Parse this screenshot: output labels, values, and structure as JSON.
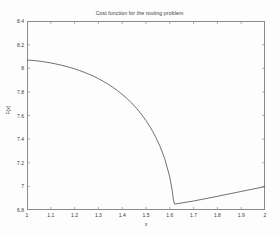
{
  "chart_data": {
    "type": "line",
    "title": "Cost function for the routing problem",
    "xlabel": "x",
    "ylabel": "F(x)",
    "xlim": [
      1,
      2
    ],
    "ylim": [
      6.8,
      8.4
    ],
    "grid": false,
    "legend": null,
    "xticks": [
      "1",
      "1.1",
      "1.2",
      "1.3",
      "1.4",
      "1.5",
      "1.6",
      "1.7",
      "1.8",
      "1.9",
      "2"
    ],
    "xtick_values": [
      1,
      1.1,
      1.2,
      1.3,
      1.4,
      1.5,
      1.6,
      1.7,
      1.8,
      1.9,
      2
    ],
    "yticks": [
      "6.8",
      "7",
      "7.2",
      "7.4",
      "7.6",
      "7.8",
      "8",
      "8.2",
      "8.4"
    ],
    "ytick_values": [
      6.8,
      7,
      7.2,
      7.4,
      7.6,
      7.8,
      8,
      8.2,
      8.4
    ],
    "line_color": "#4d4d4d",
    "series": [
      {
        "name": "F(x)",
        "x": [
          1.0,
          1.02,
          1.04,
          1.06,
          1.08,
          1.1,
          1.12,
          1.14,
          1.16,
          1.18,
          1.2,
          1.22,
          1.24,
          1.26,
          1.28,
          1.3,
          1.32,
          1.34,
          1.36,
          1.38,
          1.4,
          1.42,
          1.44,
          1.46,
          1.48,
          1.5,
          1.52,
          1.54,
          1.56,
          1.58,
          1.6,
          1.61,
          1.615,
          1.62,
          1.62,
          1.7,
          1.8,
          1.9,
          2.0
        ],
        "y": [
          8.07,
          8.067,
          8.063,
          8.058,
          8.052,
          8.045,
          8.037,
          8.028,
          8.018,
          8.007,
          7.995,
          7.981,
          7.966,
          7.95,
          7.932,
          7.912,
          7.89,
          7.866,
          7.84,
          7.811,
          7.779,
          7.744,
          7.705,
          7.661,
          7.612,
          7.557,
          7.494,
          7.421,
          7.334,
          7.226,
          7.078,
          6.965,
          6.89,
          6.85,
          6.85,
          6.876,
          6.916,
          6.957,
          6.998
        ]
      }
    ]
  }
}
